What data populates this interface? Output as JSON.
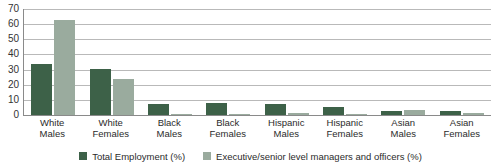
{
  "chart_data": {
    "type": "bar",
    "title": "",
    "subtitle": "",
    "xlabel": "",
    "ylabel": "",
    "ylim": [
      0,
      70
    ],
    "ytick_step": 10,
    "yticks": [
      70,
      60,
      50,
      40,
      30,
      20,
      10,
      0
    ],
    "grid": true,
    "legend_position": "bottom-center",
    "categories": [
      "White Males",
      "White Females",
      "Black Males",
      "Black Females",
      "Hispanic Males",
      "Hispanic Females",
      "Asian Males",
      "Asian Females"
    ],
    "category_lines": [
      {
        "line1": "White",
        "line2": "Males"
      },
      {
        "line1": "White",
        "line2": "Females"
      },
      {
        "line1": "Black",
        "line2": "Males"
      },
      {
        "line1": "Black",
        "line2": "Females"
      },
      {
        "line1": "Hispanic",
        "line2": "Males"
      },
      {
        "line1": "Hispanic",
        "line2": "Females"
      },
      {
        "line1": "Asian",
        "line2": "Males"
      },
      {
        "line1": "Asian",
        "line2": "Females"
      }
    ],
    "series": [
      {
        "name": "Total Employment (%)",
        "color": "#3d6148",
        "values": [
          34,
          30.5,
          7,
          8,
          7.5,
          5.5,
          2.5,
          2.5
        ]
      },
      {
        "name": "Executive/senior level managers and officers (%)",
        "color": "#9aab9e",
        "values": [
          63,
          24,
          1,
          1,
          1.5,
          1,
          3.5,
          1.5
        ]
      }
    ]
  },
  "colors": {
    "series_total_employment": "#3d6148",
    "series_executive_managers": "#9aab9e",
    "gridline": "#b9b9b9",
    "axis": "#8a8a8a",
    "text": "#2b2b2b",
    "background": "#ffffff"
  }
}
